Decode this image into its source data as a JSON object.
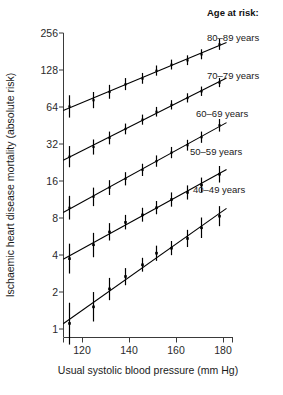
{
  "chart_data": {
    "type": "scatter",
    "title": "",
    "xlabel": "Usual systolic blood pressure (mm Hg)",
    "ylabel": "Ischaemic heart disease mortality (absolute risk)",
    "xlim": [
      112,
      186
    ],
    "ylim": [
      0.72,
      300
    ],
    "yscale": "log2",
    "grid": false,
    "legend_position": "right",
    "legend_title": "Age at risk:",
    "xticks": [
      120,
      140,
      160,
      180
    ],
    "xtick_labels": [
      "120",
      "140",
      "160",
      "180"
    ],
    "yticks": [
      1,
      2,
      4,
      8,
      16,
      32,
      64,
      128,
      256
    ],
    "ytick_labels": [
      "1",
      "2",
      "4",
      "8",
      "16",
      "32",
      "64",
      "128",
      "256"
    ],
    "marker": "filled-square-with-vertical-ci-bar",
    "note": "Floating absolute risks with 95% confidence intervals; each series fitted with a straight log-linear trend line.",
    "series": [
      {
        "name": "80-89 years",
        "label": "80–89 years",
        "color": "#000000",
        "x": [
          114.5,
          124.5,
          131.5,
          138.5,
          145.5,
          151.5,
          158.0,
          164.5,
          170.5,
          178.5
        ],
        "y": [
          64.0,
          72.0,
          84.0,
          97.0,
          108.0,
          125.0,
          140.0,
          152.0,
          170.0,
          205.0
        ],
        "ci_low": [
          52.0,
          62.0,
          74.0,
          87.0,
          98.0,
          114.0,
          128.0,
          139.0,
          155.0,
          185.0
        ],
        "ci_high": [
          79.0,
          84.0,
          96.0,
          109.0,
          120.0,
          138.0,
          154.0,
          167.0,
          187.0,
          227.0
        ]
      },
      {
        "name": "70-79 years",
        "label": "70–79 years",
        "color": "#000000",
        "x": [
          114.5,
          124.5,
          131.5,
          138.5,
          145.5,
          151.5,
          158.0,
          164.5,
          170.5,
          178.5
        ],
        "y": [
          25.0,
          30.0,
          35.5,
          42.0,
          50.0,
          58.0,
          66.0,
          75.0,
          85.0,
          100.0
        ],
        "ci_low": [
          20.5,
          26.0,
          31.5,
          38.0,
          45.5,
          53.0,
          60.5,
          69.0,
          78.0,
          92.0
        ],
        "ci_high": [
          30.5,
          34.5,
          40.0,
          46.5,
          55.0,
          63.5,
          72.0,
          82.0,
          93.0,
          109.0
        ]
      },
      {
        "name": "60-69 years",
        "label": "60–69 years",
        "color": "#000000",
        "x": [
          114.5,
          124.5,
          131.5,
          138.5,
          145.5,
          151.5,
          158.0,
          164.5,
          170.5,
          178.5
        ],
        "y": [
          9.6,
          11.8,
          14.0,
          16.5,
          19.5,
          23.0,
          27.0,
          31.0,
          36.0,
          45.0
        ],
        "ci_low": [
          7.7,
          9.9,
          12.2,
          14.6,
          17.4,
          20.7,
          24.3,
          28.0,
          32.4,
          40.0
        ],
        "ci_high": [
          12.0,
          14.0,
          16.1,
          18.7,
          21.9,
          25.6,
          30.0,
          34.3,
          40.0,
          50.6
        ]
      },
      {
        "name": "50-59 years",
        "label": "50–59 years",
        "color": "#000000",
        "x": [
          114.5,
          124.5,
          131.5,
          138.5,
          145.5,
          151.5,
          158.0,
          164.5,
          170.5,
          178.5
        ],
        "y": [
          3.7,
          4.8,
          6.1,
          7.3,
          8.4,
          9.6,
          11.2,
          12.8,
          14.7,
          18.0
        ],
        "ci_low": [
          2.8,
          3.8,
          5.2,
          6.4,
          7.4,
          8.5,
          9.8,
          11.2,
          12.8,
          15.4
        ],
        "ci_high": [
          4.9,
          6.0,
          7.2,
          8.4,
          9.6,
          10.9,
          12.8,
          14.6,
          16.9,
          21.0
        ]
      },
      {
        "name": "40-49 years",
        "label": "40–49 years",
        "color": "#000000",
        "x": [
          114.5,
          124.5,
          131.5,
          138.5,
          145.5,
          151.5,
          158.0,
          164.5,
          170.5,
          178.5
        ],
        "y": [
          1.1,
          1.5,
          2.1,
          2.65,
          3.3,
          4.1,
          4.5,
          5.4,
          6.6,
          8.2
        ],
        "ci_low": [
          0.74,
          1.14,
          1.7,
          2.25,
          2.9,
          3.55,
          3.95,
          4.6,
          5.45,
          6.8
        ],
        "ci_high": [
          1.62,
          1.98,
          2.58,
          3.1,
          3.76,
          4.72,
          5.15,
          6.35,
          8.0,
          9.9
        ]
      }
    ]
  },
  "axes": {
    "x_title": "Usual systolic blood pressure (mm Hg)",
    "y_title": "Ischaemic heart disease mortality (absolute risk)",
    "x_tick_120": "120",
    "x_tick_140": "140",
    "x_tick_160": "160",
    "x_tick_180": "180",
    "y_tick_1": "1",
    "y_tick_2": "2",
    "y_tick_4": "4",
    "y_tick_8": "8",
    "y_tick_16": "16",
    "y_tick_32": "32",
    "y_tick_64": "64",
    "y_tick_128": "128",
    "y_tick_256": "256"
  },
  "legend": {
    "title": "Age at risk:",
    "items": [
      {
        "label": "80–89 years"
      },
      {
        "label": "70–79 years"
      },
      {
        "label": "60–69 years"
      },
      {
        "label": "50–59 years"
      },
      {
        "label": "40–49 years"
      }
    ]
  }
}
